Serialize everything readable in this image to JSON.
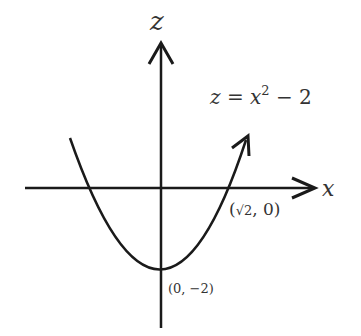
{
  "diagram": {
    "type": "parabola-graph",
    "axes": {
      "horizontal_label": "x",
      "vertical_label": "z"
    },
    "curve": {
      "equation_lhs": "z = x",
      "equation_exp": "2",
      "equation_rhs": " − 2"
    },
    "points": {
      "root": {
        "prefix": "(",
        "sqrt": "√2",
        "suffix": ", 0)"
      },
      "vertex": "(0, −2)"
    },
    "colors": {
      "stroke": "#1a1a1a",
      "text": "#333333",
      "background": "#ffffff"
    }
  }
}
